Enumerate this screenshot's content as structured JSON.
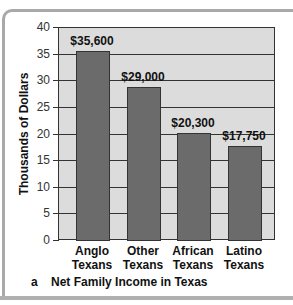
{
  "chart_data": {
    "type": "bar",
    "title": "Net Family Income in Texas",
    "panel_label": "a",
    "xlabel": "",
    "ylabel": "Thousands of Dollars",
    "ylim": [
      0,
      40
    ],
    "yticks": [
      0,
      5,
      10,
      15,
      20,
      25,
      30,
      35,
      40
    ],
    "grid": true,
    "categories": [
      "Anglo Texans",
      "Other Texans",
      "African Texans",
      "Latino Texans"
    ],
    "category_lines": [
      [
        "Anglo",
        "Texans"
      ],
      [
        "Other",
        "Texans"
      ],
      [
        "African",
        "Texans"
      ],
      [
        "Latino",
        "Texans"
      ]
    ],
    "values": [
      35.6,
      29.0,
      20.3,
      17.75
    ],
    "data_labels": [
      "$35,600",
      "$29,000",
      "$20,300",
      "$17,750"
    ],
    "colors": {
      "bar": "#6b6b6b",
      "plot_background": "#dcdcdc",
      "grid": "#333333"
    }
  }
}
